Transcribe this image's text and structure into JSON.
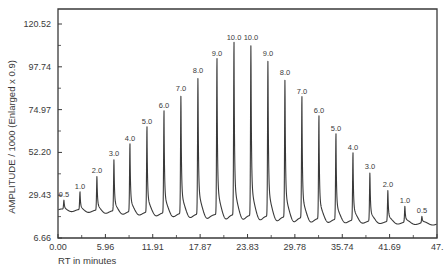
{
  "chart_data": {
    "type": "line",
    "title": "",
    "xlabel": "RT in minutes",
    "ylabel": "AMPLITUDE / 1000  (Enlarged x   0.9)",
    "xlim": [
      0.0,
      47.65
    ],
    "ylim": [
      6.66,
      120.52
    ],
    "grid": false,
    "x_ticks": [
      "0.00",
      "5.96",
      "11.91",
      "17.87",
      "23.83",
      "29.78",
      "35.74",
      "41.69",
      "47."
    ],
    "x_tick_values": [
      0.0,
      5.96,
      11.91,
      17.87,
      23.83,
      29.78,
      35.74,
      41.69,
      47.65
    ],
    "y_ticks": [
      "6.66",
      "29.43",
      "52.20",
      "74.97",
      "97.74",
      "120.52"
    ],
    "y_tick_values": [
      6.66,
      29.43,
      52.2,
      74.97,
      97.74,
      120.52
    ],
    "baseline_start": 21.6,
    "baseline_end": 14.1,
    "peaks": [
      {
        "label": "0.5",
        "rt": 0.75,
        "amplitude": 26.3
      },
      {
        "label": "1.0",
        "rt": 2.77,
        "amplitude": 30.6
      },
      {
        "label": "2.0",
        "rt": 4.9,
        "amplitude": 39.1
      },
      {
        "label": "3.0",
        "rt": 7.04,
        "amplitude": 48.2
      },
      {
        "label": "4.0",
        "rt": 9.05,
        "amplitude": 56.1
      },
      {
        "label": "5.0",
        "rt": 11.19,
        "amplitude": 65.2
      },
      {
        "label": "6.0",
        "rt": 13.33,
        "amplitude": 73.7
      },
      {
        "label": "7.0",
        "rt": 15.46,
        "amplitude": 82.7
      },
      {
        "label": "8.0",
        "rt": 17.6,
        "amplitude": 92.3
      },
      {
        "label": "9.0",
        "rt": 19.99,
        "amplitude": 101.4
      },
      {
        "label": "10.0",
        "rt": 22.13,
        "amplitude": 109.9
      },
      {
        "label": "10.0",
        "rt": 24.26,
        "amplitude": 109.9
      },
      {
        "label": "9.0",
        "rt": 26.4,
        "amplitude": 101.4
      },
      {
        "label": "8.0",
        "rt": 28.54,
        "amplitude": 91.2
      },
      {
        "label": "7.0",
        "rt": 30.67,
        "amplitude": 81.1
      },
      {
        "label": "6.0",
        "rt": 32.81,
        "amplitude": 71.0
      },
      {
        "label": "5.0",
        "rt": 34.95,
        "amplitude": 61.5
      },
      {
        "label": "4.0",
        "rt": 37.09,
        "amplitude": 51.4
      },
      {
        "label": "3.0",
        "rt": 39.22,
        "amplitude": 41.2
      },
      {
        "label": "2.0",
        "rt": 41.48,
        "amplitude": 31.7
      },
      {
        "label": "1.0",
        "rt": 43.62,
        "amplitude": 23.2
      },
      {
        "label": "0.5",
        "rt": 45.76,
        "amplitude": 17.8
      }
    ],
    "line_color": "#3a3a3a"
  }
}
